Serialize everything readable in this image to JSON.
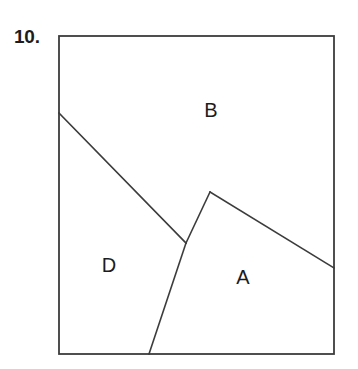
{
  "figure": {
    "problem_number": "10.",
    "stroke_color": "#3c3c3c",
    "background_color": "#ffffff",
    "text_color": "#1c1c1c",
    "canvas": {
      "width": 358,
      "height": 369
    },
    "border_rect": {
      "x": 59,
      "y": 36,
      "width": 275,
      "height": 318
    },
    "region_labels": [
      {
        "id": "B",
        "text": "B",
        "x": 211,
        "y": 112
      },
      {
        "id": "D",
        "text": "D",
        "x": 109,
        "y": 267
      },
      {
        "id": "A",
        "text": "A",
        "x": 243,
        "y": 279
      }
    ],
    "vertices": {
      "left_edge_start": {
        "x": 59,
        "y": 113
      },
      "junction": {
        "x": 186,
        "y": 243
      },
      "apex": {
        "x": 210,
        "y": 192
      },
      "right_edge_end": {
        "x": 334,
        "y": 268
      },
      "bottom_edge_end": {
        "x": 149,
        "y": 354
      }
    },
    "segments": [
      {
        "id": "d-b-boundary",
        "points": "59,113 186,243"
      },
      {
        "id": "d-a-boundary",
        "points": "186,243 210,192"
      },
      {
        "id": "d-a-lower-boundary",
        "points": "186,243 149,354"
      },
      {
        "id": "b-a-boundary",
        "points": "210,192 334,268"
      }
    ]
  }
}
